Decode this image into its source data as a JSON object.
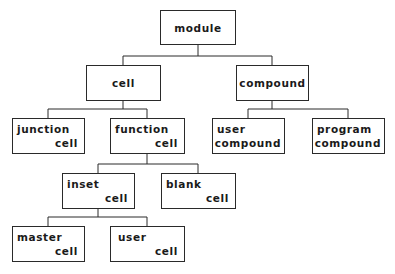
{
  "diagram": {
    "type": "tree",
    "line_color": "#2a2a2a",
    "nodes": {
      "module": {
        "l1": "module"
      },
      "cell": {
        "l1": "cell"
      },
      "compound": {
        "l1": "compound"
      },
      "junction_cell": {
        "l1": "junction",
        "l2": "cell"
      },
      "function_cell": {
        "l1": "function",
        "l2": "cell"
      },
      "user_compound": {
        "l1": "user",
        "l2": "compound"
      },
      "program_compound": {
        "l1": "program",
        "l2": "compound"
      },
      "inset_cell": {
        "l1": "inset",
        "l2": "cell"
      },
      "blank_cell": {
        "l1": "blank",
        "l2": "cell"
      },
      "master_cell": {
        "l1": "master",
        "l2": "cell"
      },
      "user_cell": {
        "l1": "user",
        "l2": "cell"
      }
    },
    "edges": [
      [
        "module",
        "cell"
      ],
      [
        "module",
        "compound"
      ],
      [
        "cell",
        "junction_cell"
      ],
      [
        "cell",
        "function_cell"
      ],
      [
        "compound",
        "user_compound"
      ],
      [
        "compound",
        "program_compound"
      ],
      [
        "function_cell",
        "inset_cell"
      ],
      [
        "function_cell",
        "blank_cell"
      ],
      [
        "inset_cell",
        "master_cell"
      ],
      [
        "inset_cell",
        "user_cell"
      ]
    ]
  }
}
